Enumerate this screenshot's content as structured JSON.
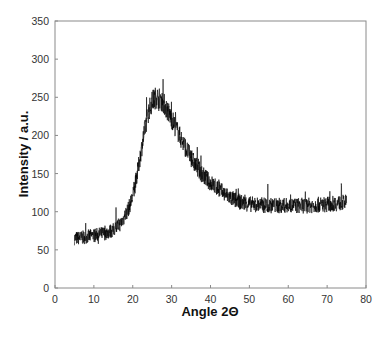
{
  "chart_data": {
    "type": "line",
    "title": "",
    "xlabel": "Angle 2Θ",
    "ylabel": "Intensity / a.u.",
    "xlim": [
      0,
      80
    ],
    "ylim": [
      0,
      350
    ],
    "xticks": [
      0,
      10,
      20,
      30,
      40,
      50,
      60,
      70,
      80
    ],
    "yticks": [
      0,
      50,
      100,
      150,
      200,
      250,
      300,
      350
    ],
    "grid": false,
    "legend": null,
    "line_color": "#000000",
    "noise_amplitude": 12,
    "series": [
      {
        "name": "XRD pattern",
        "x": [
          5,
          7,
          9,
          11,
          13,
          15,
          17,
          19,
          20,
          21,
          22,
          23,
          24,
          25,
          26,
          27,
          28,
          29,
          30,
          32,
          34,
          36,
          38,
          40,
          42,
          44,
          46,
          48,
          50,
          55,
          60,
          65,
          70,
          75
        ],
        "y": [
          65,
          66,
          68,
          70,
          72,
          76,
          85,
          105,
          120,
          145,
          175,
          205,
          230,
          245,
          250,
          248,
          242,
          232,
          222,
          200,
          180,
          162,
          148,
          138,
          130,
          122,
          116,
          112,
          110,
          108,
          108,
          108,
          110,
          112
        ]
      }
    ],
    "annotations": [
      {
        "text": "broad peak maximum",
        "x": 26,
        "y": 250
      }
    ]
  }
}
